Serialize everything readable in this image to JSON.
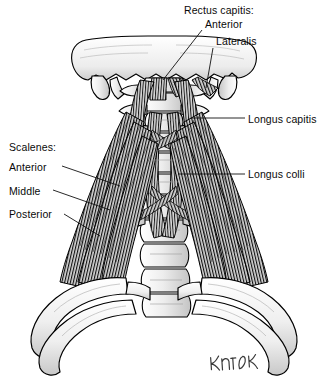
{
  "figure": {
    "background_color": "#ffffff",
    "ink_color": "#000000",
    "bone_fill_light": "#f2f2f2",
    "bone_fill_mid": "#d8d8d8",
    "bone_shadow": "#b5b5b5",
    "muscle_fill": "#cfcfcf",
    "muscle_stripe": "#1b1b1b",
    "leader_color": "#111111"
  },
  "labels": {
    "rectus_capitis_header": "Rectus capitis:",
    "rectus_capitis_anterior": "Anterior",
    "rectus_capitis_lateralis": "Lateralis",
    "longus_capitis": "Longus capitis",
    "longus_colli": "Longus colli",
    "scalenes_header": "Scalenes:",
    "scalene_anterior": "Anterior",
    "scalene_middle": "Middle",
    "scalene_posterior": "Posterior"
  },
  "signature": "artist-signature"
}
